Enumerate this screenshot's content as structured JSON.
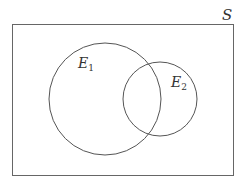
{
  "diagram": {
    "type": "venn",
    "universe": {
      "label": "S",
      "x": 12,
      "y": 24,
      "width": 221,
      "height": 151
    },
    "sets": [
      {
        "label": "E",
        "subscript": "1",
        "cx": 105,
        "cy": 99,
        "r": 56
      },
      {
        "label": "E",
        "subscript": "2",
        "cx": 160,
        "cy": 99,
        "r": 37
      }
    ],
    "stroke_color": "#555555",
    "background": "#ffffff"
  }
}
